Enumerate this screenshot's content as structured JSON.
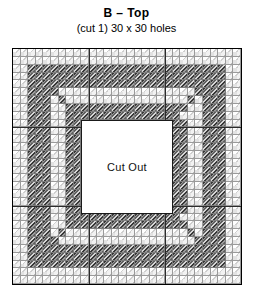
{
  "header": {
    "title": "B – Top",
    "subtitle": "(cut 1) 30 x 30 holes"
  },
  "cutout": {
    "label": "Cut Out"
  },
  "colors": {
    "background": "#ffffff",
    "grid_line": "#9a9a9a",
    "frame_border": "#000000",
    "hatch_dark": "#4a4a4a",
    "hatch_light": "#d6d6d6",
    "canvas_light": "#f2f2f2",
    "text": "#000000",
    "divider": "#2b2b2b"
  },
  "chart_data": {
    "type": "heatmap",
    "title": "B – Top",
    "subtitle": "(cut 1) 30 x 30 holes",
    "xlabel": "",
    "ylabel": "",
    "grid": true,
    "legend": "none",
    "columns": 30,
    "rows": 30,
    "cell_values": {
      "light": "plain canvas hole",
      "dark": "stitched / diagonal hatch",
      "cut": "cut out opening"
    },
    "cutout_region": {
      "col_start": 9,
      "col_end": 20,
      "row_start": 9,
      "row_end": 20
    },
    "band": {
      "inset_cells": 2,
      "thickness_cells": 3,
      "description": "dark diagonal-hatched square frame band inset 2 cells from outer edge, 3 cells thick, with diagonal corner accents running inward"
    },
    "sector_dividers": {
      "every_holes": 10,
      "columns": [
        10,
        20
      ],
      "rows": [
        10,
        20
      ]
    },
    "matrix": [
      "000000000000000000000000000000",
      "000000000000000000000000000000",
      "001111111111111111111111111100",
      "001111111111111111111111111100",
      "001111111111111111111111111100",
      "001110000000000000000000011100",
      "001110000000000000000000011100",
      "001110011111111111111100011100",
      "001110011111111111111100011100",
      "001110011222222222222110011100",
      "001110011222222222222110011100",
      "001110011222222222222110011100",
      "001110011222222222222110011100",
      "001110011222222222222110011100",
      "001110011222222222222110011100",
      "001110011222222222222110011100",
      "001110011222222222222110011100",
      "001110011222222222222110011100",
      "001110011222222222222110011100",
      "001110011222222222222110011100",
      "001110011222222222222110011100",
      "001110011111111111111100011100",
      "001110011111111111111100011100",
      "001110000000000000000000011100",
      "001110000000000000000000011100",
      "001111111111111111111111111100",
      "001111111111111111111111111100",
      "001111111111111111111111111100",
      "000000000000000000000000000000",
      "000000000000000000000000000000"
    ],
    "matrix_legend": {
      "0": "light",
      "1": "dark",
      "2": "cutout"
    }
  }
}
